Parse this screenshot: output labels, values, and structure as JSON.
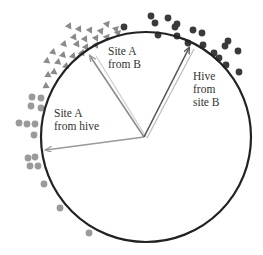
{
  "diagram": {
    "type": "circular-orientation-plot",
    "circle": {
      "cx": 146,
      "cy": 137,
      "r": 105,
      "stroke": "#222222"
    },
    "colors": {
      "triangles": "#8a8a8a",
      "grey_dots": "#9a9a9a",
      "dark_dots": "#3a3a3a",
      "arrow_light": "#999999",
      "arrow_dark": "#555555"
    },
    "labels": {
      "site_a_from_b": [
        "Site A",
        "from B"
      ],
      "hive_from_site_b": [
        "Hive",
        "from",
        "site B"
      ],
      "site_a_from_hive": [
        "Site A",
        "from hive"
      ]
    },
    "arrows": [
      {
        "name": "site-a-from-hive",
        "x2": 46,
        "y2": 150
      },
      {
        "name": "site-a-from-b",
        "x2": 90,
        "y2": 56
      },
      {
        "name": "hive-from-site-b",
        "x2": 189,
        "y2": 48
      }
    ],
    "triangles": [
      [
        69,
        26
      ],
      [
        79,
        29
      ],
      [
        90,
        30
      ],
      [
        101,
        31
      ],
      [
        107,
        24
      ],
      [
        116,
        29
      ],
      [
        74,
        37
      ],
      [
        85,
        39
      ],
      [
        96,
        38
      ],
      [
        107,
        37
      ],
      [
        118,
        33
      ],
      [
        64,
        44
      ],
      [
        77,
        44
      ],
      [
        86,
        47
      ],
      [
        96,
        45
      ],
      [
        53,
        52
      ],
      [
        63,
        55
      ],
      [
        73,
        56
      ],
      [
        82,
        53
      ],
      [
        47,
        61
      ],
      [
        58,
        62
      ],
      [
        66,
        66
      ],
      [
        54,
        72
      ],
      [
        48,
        75
      ],
      [
        46,
        86
      ]
    ],
    "grey_dots": [
      [
        32,
        97
      ],
      [
        41,
        98
      ],
      [
        31,
        106
      ],
      [
        41,
        108
      ],
      [
        19,
        123
      ],
      [
        27,
        124
      ],
      [
        35,
        124
      ],
      [
        34,
        135
      ],
      [
        28,
        158
      ],
      [
        35,
        157
      ],
      [
        30,
        166
      ],
      [
        38,
        166
      ],
      [
        44,
        184
      ],
      [
        60,
        208
      ],
      [
        89,
        233
      ]
    ],
    "dark_dots": [
      [
        124,
        27
      ],
      [
        155,
        23
      ],
      [
        177,
        24
      ],
      [
        177,
        36
      ],
      [
        158,
        35
      ],
      [
        175,
        27
      ],
      [
        193,
        30
      ],
      [
        188,
        43
      ],
      [
        202,
        33
      ],
      [
        203,
        45
      ],
      [
        214,
        53
      ],
      [
        225,
        46
      ],
      [
        219,
        58
      ],
      [
        228,
        41
      ],
      [
        238,
        51
      ],
      [
        226,
        65
      ],
      [
        239,
        72
      ],
      [
        151,
        16
      ],
      [
        168,
        18
      ]
    ]
  }
}
